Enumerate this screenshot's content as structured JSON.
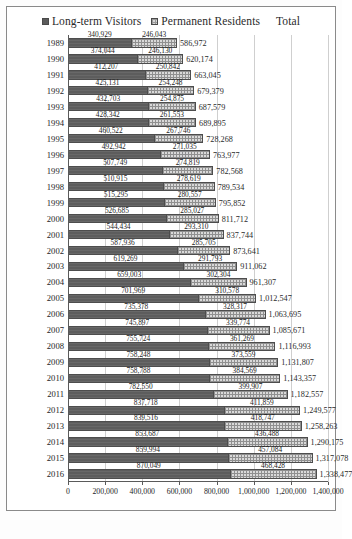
{
  "legend": {
    "series": [
      {
        "label": "Long-term Visitors",
        "key": "ltv",
        "color": "#5d5d5d"
      },
      {
        "label": "Permanent Residents",
        "key": "pr",
        "color": "#d9d9d9"
      }
    ],
    "total_label": "Total"
  },
  "axis": {
    "x_ticks": [
      "0",
      "200,000",
      "400,000",
      "600,000",
      "800,000",
      "1,000,000",
      "1,200,000",
      "1,400,000"
    ],
    "x_tick_values": [
      0,
      200000,
      400000,
      600000,
      800000,
      1000000,
      1200000,
      1400000
    ],
    "x_min": 0,
    "x_max": 1400000
  },
  "chart_data": {
    "type": "bar",
    "orientation": "horizontal",
    "stacked": true,
    "title": "",
    "xlabel": "",
    "ylabel": "",
    "xlim": [
      0,
      1400000
    ],
    "grid": true,
    "legend_position": "top-center",
    "categories": [
      "1989",
      "1990",
      "1991",
      "1992",
      "1993",
      "1994",
      "1995",
      "1996",
      "1997",
      "1998",
      "1999",
      "2000",
      "2001",
      "2002",
      "2003",
      "2004",
      "2005",
      "2006",
      "2007",
      "2008",
      "2009",
      "2010",
      "2011",
      "2012",
      "2013",
      "2014",
      "2015",
      "2016"
    ],
    "series": [
      {
        "name": "Long-term Visitors",
        "values": [
          340929,
          374044,
          412207,
          425131,
          432703,
          428342,
          460522,
          492942,
          507749,
          510915,
          515295,
          526685,
          544434,
          587936,
          619269,
          659003,
          701969,
          735378,
          745897,
          755724,
          758248,
          758788,
          782550,
          837718,
          839516,
          853687,
          859994,
          870049
        ],
        "labels": [
          "340,929",
          "374,044",
          "412,207",
          "425,131",
          "432,703",
          "428,342",
          "460,522",
          "492,942",
          "507,749",
          "510,915",
          "515,295",
          "526,685",
          "544,434",
          "587,936",
          "619,269",
          "659,003",
          "701,969",
          "735,378",
          "745,897",
          "755,724",
          "758,248",
          "758,788",
          "782,550",
          "837,718",
          "839,516",
          "853,687",
          "859,994",
          "870,049"
        ]
      },
      {
        "name": "Permanent Residents",
        "values": [
          246043,
          246130,
          250842,
          254248,
          254875,
          261553,
          267746,
          271035,
          274819,
          278619,
          280557,
          285027,
          293310,
          285705,
          291793,
          302304,
          310578,
          328317,
          339774,
          361269,
          373559,
          384569,
          399907,
          411859,
          418747,
          436488,
          457084,
          468428
        ],
        "labels": [
          "246,043",
          "246,130",
          "250,842",
          "254,248",
          "254,875",
          "261,553",
          "267,746",
          "271,035",
          "274,819",
          "278,619",
          "280,557",
          "285,027",
          "293,310",
          "285,705",
          "291,793",
          "302,304",
          "310,578",
          "328,317",
          "339,774",
          "361,269",
          "373,559",
          "384,569",
          "399,907",
          "411,859",
          "418,747",
          "436,488",
          "457,084",
          "468,428"
        ]
      }
    ],
    "totals": [
      586972,
      620174,
      663045,
      679379,
      687579,
      689895,
      728268,
      763977,
      782568,
      789534,
      795852,
      811712,
      837744,
      873641,
      911062,
      961307,
      1012547,
      1063695,
      1085671,
      1116993,
      1131807,
      1143357,
      1182557,
      1249577,
      1258263,
      1290175,
      1317078,
      1338477
    ],
    "total_labels": [
      "586,972",
      "620,174",
      "663,045",
      "679,379",
      "687,579",
      "689,895",
      "728,268",
      "763,977",
      "782,568",
      "789,534",
      "795,852",
      "811,712",
      "837,744",
      "873,641",
      "911,062",
      "961,307",
      "1,012,547",
      "1,063,695",
      "1,085,671",
      "1,116,993",
      "1,131,807",
      "1,143,357",
      "1,182,557",
      "1,249,577",
      "1,258,263",
      "1,290,175",
      "1,317,078",
      "1,338,477"
    ]
  }
}
